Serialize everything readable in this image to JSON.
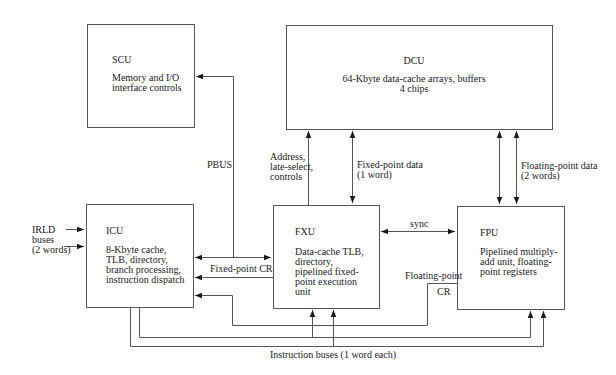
{
  "diagram": {
    "colors": {
      "line": "#555555",
      "text": "#1a1a1a",
      "background": "#ffffff"
    },
    "units": {
      "scu": {
        "name": "SCU",
        "description": "Memory and I/O\ninterface controls"
      },
      "dcu": {
        "name": "DCU",
        "description": "64-Kbyte data-cache arrays, buffers\n4 chips"
      },
      "icu": {
        "name": "ICU",
        "description": "8-Kbyte cache,\nTLB, directory,\nbranch processing,\ninstruction dispatch"
      },
      "fxu": {
        "name": "FXU",
        "description": "Data-cache TLB,\ndirectory,\npipelined fixed-\npoint execution\nunit"
      },
      "fpu": {
        "name": "FPU",
        "description": "Pipelined multiply-\nadd unit, floating-\npoint registers"
      }
    },
    "labels": {
      "pbus": "PBUS",
      "address": "Address,\nlate-select,\ncontrols",
      "fixed_point_data": "Fixed-point data\n(1 word)",
      "floating_point_data": "Floating-point data\n(2 words)",
      "irld": "IRLD\nbuses\n(2 words)",
      "fixed_point_cr": "Fixed-point CR",
      "sync": "sync",
      "floating_point_cr_line1": "Floating-point",
      "floating_point_cr_line2": "CR",
      "instruction_buses": "Instruction buses (1 word each)"
    },
    "connections": [
      {
        "from": "FXU",
        "to": "SCU",
        "label": "PBUS",
        "direction": "to SCU, bidirectional with ICU"
      },
      {
        "from": "FXU",
        "to": "DCU",
        "label": "Address, late-select, controls",
        "direction": "one-way"
      },
      {
        "from": "FXU",
        "to": "DCU",
        "label": "Fixed-point data (1 word)",
        "direction": "bidirectional"
      },
      {
        "from": "FPU",
        "to": "DCU",
        "label": "Floating-point data (2 words)",
        "direction": "bidirectional, 2 lines"
      },
      {
        "from": "external",
        "to": "ICU",
        "label": "IRLD buses (2 words)",
        "direction": "one-way, 2 lines"
      },
      {
        "from": "ICU",
        "to": "FXU",
        "label": "",
        "direction": "bidirectional"
      },
      {
        "from": "FXU",
        "to": "ICU",
        "label": "Fixed-point CR",
        "direction": "one-way"
      },
      {
        "from": "FXU",
        "to": "FPU",
        "label": "sync",
        "direction": "bidirectional"
      },
      {
        "from": "FPU",
        "to": "ICU",
        "label": "Floating-point CR",
        "direction": "one-way"
      },
      {
        "from": "ICU",
        "to": "FXU,FPU",
        "label": "Instruction buses (1 word each)",
        "direction": "one-way, 2 buses"
      }
    ]
  }
}
